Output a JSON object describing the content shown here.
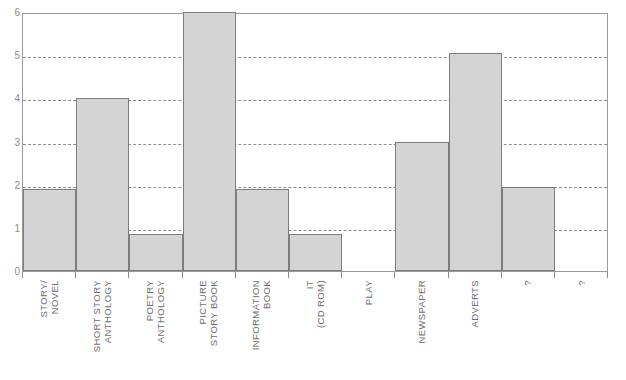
{
  "chart_data": {
    "type": "bar",
    "title": "",
    "xlabel": "",
    "ylabel": "",
    "ylim": [
      0,
      6
    ],
    "yticks": [
      0,
      1,
      2,
      3,
      4,
      5,
      6
    ],
    "ytick_labels": [
      "0",
      "1",
      "2",
      "3",
      "4",
      "5",
      "6"
    ],
    "grid": true,
    "gridlines_at": [
      1,
      2,
      3,
      4,
      5
    ],
    "legend": "none",
    "bar_color": "#d4d4d4",
    "bar_edge_color": "#7d7d7d",
    "axis_color": "#9a9a9a",
    "tick_label_color": "#8c8c8c",
    "category_label_color": "#6e6e6e",
    "categories": [
      "STORY/ NOVEL",
      "SHORT STORY ANTHOLOGY",
      "POETRY ANTHOLOGY",
      "PICTURE STORY BOOK",
      "INFORMATION BOOK",
      "IT (CD ROM)",
      "PLAY",
      "NEWSPAPER",
      "ADVERTS",
      "?",
      "?"
    ],
    "category_lines": [
      [
        "STORY/",
        "NOVEL"
      ],
      [
        "SHORT STORY",
        "ANTHOLOGY"
      ],
      [
        "POETRY",
        "ANTHOLOGY"
      ],
      [
        "PICTURE",
        "STORY BOOK"
      ],
      [
        "INFORMATION",
        "BOOK"
      ],
      [
        "IT",
        "(CD ROM)"
      ],
      [
        "PLAY",
        ""
      ],
      [
        "NEWSPAPER",
        ""
      ],
      [
        "ADVERTS",
        ""
      ],
      [
        "?",
        ""
      ],
      [
        "?",
        ""
      ]
    ],
    "values": [
      1.9,
      4.0,
      0.85,
      6.0,
      1.9,
      0.85,
      0,
      3.0,
      5.05,
      1.95,
      0
    ]
  },
  "top_caption": ""
}
